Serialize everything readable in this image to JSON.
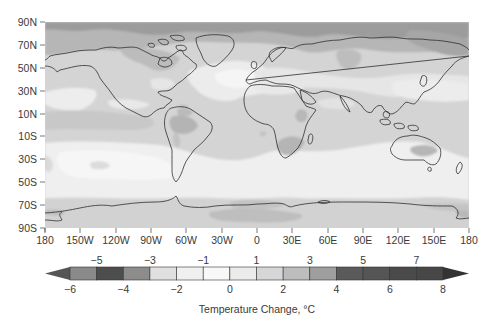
{
  "chart_data": {
    "type": "heatmap",
    "title": "",
    "subtitle": "",
    "projection": "equirectangular",
    "xlabel": "",
    "ylabel": "",
    "x_ticks": [
      "180",
      "150W",
      "120W",
      "90W",
      "60W",
      "30W",
      "0",
      "30E",
      "60E",
      "90E",
      "120E",
      "150E",
      "180"
    ],
    "y_ticks": [
      "90N",
      "70N",
      "50N",
      "30N",
      "10N",
      "10S",
      "30S",
      "50S",
      "70S",
      "90S"
    ],
    "xlim": [
      -180,
      180
    ],
    "ylim": [
      -90,
      90
    ],
    "colorbar": {
      "label": "Temperature Change, °C",
      "range": [
        -6,
        8
      ],
      "upper_tick_labels": [
        "−5",
        "−3",
        "−1",
        "1",
        "3",
        "5",
        "7"
      ],
      "upper_tick_values": [
        -5,
        -3,
        -1,
        1,
        3,
        5,
        7
      ],
      "lower_tick_labels": [
        "−6",
        "−4",
        "−2",
        "0",
        "2",
        "4",
        "6",
        "8"
      ],
      "lower_tick_values": [
        -6,
        -4,
        -2,
        0,
        2,
        4,
        6,
        8
      ],
      "extend": "both",
      "segments": [
        {
          "from": -6,
          "to": -5,
          "color": "#8a8a8a"
        },
        {
          "from": -5,
          "to": -4,
          "color": "#4d4d4d"
        },
        {
          "from": -4,
          "to": -3,
          "color": "#8c8c8c"
        },
        {
          "from": -3,
          "to": -2,
          "color": "#e0e0e0"
        },
        {
          "from": -2,
          "to": -1,
          "color": "#f0f0f0"
        },
        {
          "from": -1,
          "to": 0,
          "color": "#f8f8f8"
        },
        {
          "from": 0,
          "to": 1,
          "color": "#ebebeb"
        },
        {
          "from": 1,
          "to": 2,
          "color": "#d6d6d6"
        },
        {
          "from": 2,
          "to": 3,
          "color": "#bdbdbd"
        },
        {
          "from": 3,
          "to": 4,
          "color": "#9e9e9e"
        },
        {
          "from": 4,
          "to": 5,
          "color": "#5a5a5a"
        },
        {
          "from": 5,
          "to": 6,
          "color": "#555555"
        },
        {
          "from": 6,
          "to": 7,
          "color": "#4a4a4a"
        },
        {
          "from": 7,
          "to": 8,
          "color": "#474747"
        }
      ],
      "under_color": "#555555",
      "over_color": "#333333"
    },
    "regions_summary": [
      {
        "region": "Arctic (70N–90N)",
        "approx_change_c": "3 to 5"
      },
      {
        "region": "Northern high-latitude land (50N–70N)",
        "approx_change_c": "2 to 4"
      },
      {
        "region": "North Atlantic south of Greenland",
        "approx_change_c": "0 to 1"
      },
      {
        "region": "Mid-latitude oceans (30N–50N)",
        "approx_change_c": "0 to 2"
      },
      {
        "region": "Tropics (10S–30N)",
        "approx_change_c": "1 to 3"
      },
      {
        "region": "Amazon / interior South America",
        "approx_change_c": "3 to 4"
      },
      {
        "region": "Southern/central Africa",
        "approx_change_c": "3 to 4"
      },
      {
        "region": "Interior Australia",
        "approx_change_c": "3 to 4"
      },
      {
        "region": "Southern Ocean (30S–60S)",
        "approx_change_c": "0 to 1"
      },
      {
        "region": "Antarctic coast (60S–75S)",
        "approx_change_c": "1 to 3"
      },
      {
        "region": "Antarctica interior",
        "approx_change_c": "2 to 3"
      }
    ],
    "legend_position": "bottom",
    "grid": false
  },
  "axes": {
    "x_ticks": [
      "180",
      "150W",
      "120W",
      "90W",
      "60W",
      "30W",
      "0",
      "30E",
      "60E",
      "90E",
      "120E",
      "150E",
      "180"
    ],
    "y_ticks": [
      "90N",
      "70N",
      "50N",
      "30N",
      "10N",
      "10S",
      "30S",
      "50S",
      "70S",
      "90S"
    ]
  },
  "colorbar": {
    "label": "Temperature Change, °C",
    "upper": [
      "−5",
      "−3",
      "−1",
      "1",
      "3",
      "5",
      "7"
    ],
    "lower": [
      "−6",
      "−4",
      "−2",
      "0",
      "2",
      "4",
      "6",
      "8"
    ]
  },
  "colors": {
    "base_land_ocean": "#d6d6d6",
    "light_band": "#efefef",
    "mid_gray": "#bdbdbd",
    "dark_gray": "#9e9e9e",
    "coastline": "#2e2e2e",
    "axis": "#555555"
  }
}
